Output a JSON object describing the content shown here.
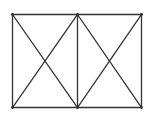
{
  "diagram": {
    "stroke_color": "#333333",
    "background": "#ffffff",
    "vertices": {
      "top_left": [
        12,
        14
      ],
      "top_mid": [
        77,
        14
      ],
      "top_right": [
        141,
        14
      ],
      "bottom_left": [
        12,
        107
      ],
      "bottom_mid": [
        77,
        107
      ],
      "bottom_right": [
        141,
        107
      ]
    },
    "segments": [
      {
        "name": "top-edge",
        "from": "top_left",
        "to": "top_right"
      },
      {
        "name": "bottom-edge",
        "from": "bottom_left",
        "to": "bottom_right"
      },
      {
        "name": "left-edge",
        "from": "top_left",
        "to": "bottom_left"
      },
      {
        "name": "right-edge",
        "from": "top_right",
        "to": "bottom_right"
      },
      {
        "name": "middle-divider",
        "from": "top_mid",
        "to": "bottom_mid"
      },
      {
        "name": "left-diagonal-1",
        "from": "top_left",
        "to": "bottom_mid"
      },
      {
        "name": "left-diagonal-2",
        "from": "bottom_left",
        "to": "top_mid"
      },
      {
        "name": "right-diagonal-1",
        "from": "top_mid",
        "to": "bottom_right"
      },
      {
        "name": "right-diagonal-2",
        "from": "bottom_mid",
        "to": "top_right"
      }
    ]
  }
}
